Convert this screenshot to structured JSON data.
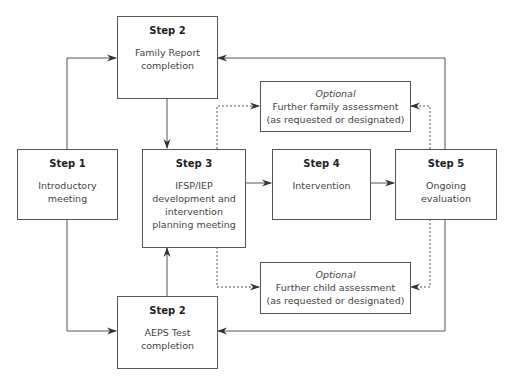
{
  "diagram": {
    "nodes": {
      "step1": {
        "step": "Step 1",
        "desc": [
          "Introductory",
          "meeting"
        ]
      },
      "step2_family": {
        "step": "Step 2",
        "desc": [
          "Family Report",
          "completion"
        ]
      },
      "step2_aeps": {
        "step": "Step 2",
        "desc": [
          "AEPS Test",
          "completion"
        ]
      },
      "step3": {
        "step": "Step 3",
        "desc": [
          "IFSP/IEP",
          "development and",
          "intervention",
          "planning meeting"
        ]
      },
      "step4": {
        "step": "Step 4",
        "desc": [
          "Intervention"
        ]
      },
      "step5": {
        "step": "Step 5",
        "desc": [
          "Ongoing",
          "evaluation"
        ]
      },
      "opt_family": {
        "label": "Optional",
        "desc": [
          "Further family assessment",
          "(as requested or designated)"
        ]
      },
      "opt_child": {
        "label": "Optional",
        "desc": [
          "Further child assessment",
          "(as requested or designated)"
        ]
      }
    },
    "edges": [
      {
        "from": "step1",
        "to": "step2_family",
        "style": "solid"
      },
      {
        "from": "step1",
        "to": "step2_aeps",
        "style": "solid"
      },
      {
        "from": "step2_family",
        "to": "step3",
        "style": "solid"
      },
      {
        "from": "step2_aeps",
        "to": "step3",
        "style": "solid"
      },
      {
        "from": "step3",
        "to": "step4",
        "style": "solid"
      },
      {
        "from": "step4",
        "to": "step5",
        "style": "solid"
      },
      {
        "from": "step5",
        "to": "step2_family",
        "style": "solid"
      },
      {
        "from": "step5",
        "to": "step2_aeps",
        "style": "solid"
      },
      {
        "from": "step3",
        "to": "opt_family",
        "style": "dotted"
      },
      {
        "from": "step3",
        "to": "opt_child",
        "style": "dotted"
      },
      {
        "from": "step5",
        "to": "opt_family",
        "style": "dotted"
      },
      {
        "from": "step5",
        "to": "opt_child",
        "style": "dotted"
      }
    ]
  }
}
